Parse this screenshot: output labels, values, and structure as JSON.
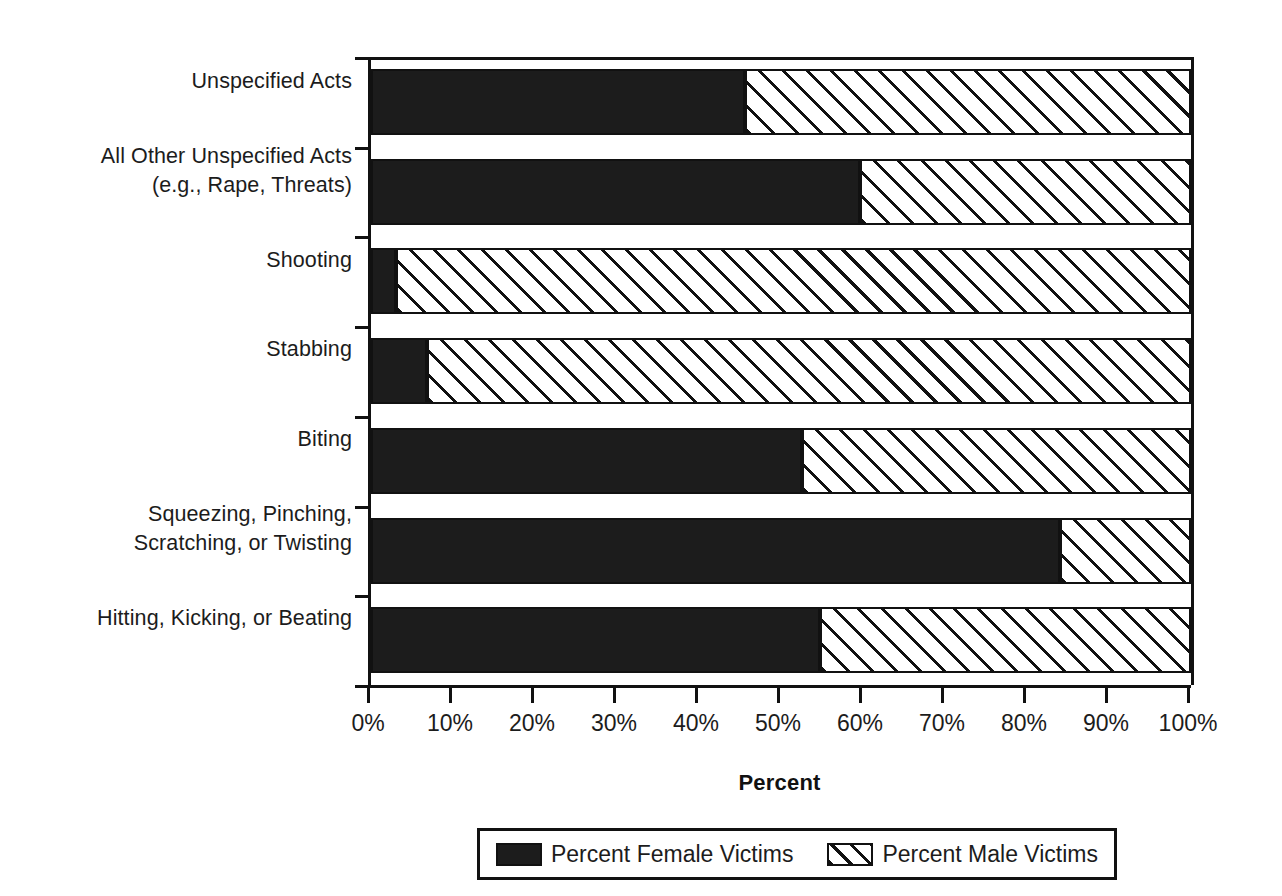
{
  "chart_data": {
    "type": "bar",
    "orientation": "horizontal",
    "stacked": true,
    "normalized": true,
    "title": "",
    "xlabel": "Percent",
    "ylabel": "",
    "xlim": [
      0,
      100
    ],
    "xticks": [
      "0%",
      "10%",
      "20%",
      "30%",
      "40%",
      "50%",
      "60%",
      "70%",
      "80%",
      "90%",
      "100%"
    ],
    "xtick_values": [
      0,
      10,
      20,
      30,
      40,
      50,
      60,
      70,
      80,
      90,
      100
    ],
    "grid": false,
    "legend_position": "bottom",
    "categories": [
      "Unspecified Acts",
      "All Other Unspecified Acts (e.g., Rape, Threats)",
      "Shooting",
      "Stabbing",
      "Biting",
      "Squeezing, Pinching, Scratching, or Twisting",
      "Hitting, Kicking, or Beating"
    ],
    "category_lines": [
      [
        "Unspecified Acts"
      ],
      [
        "All Other Unspecified Acts",
        "(e.g., Rape, Threats)"
      ],
      [
        "Shooting"
      ],
      [
        "Stabbing"
      ],
      [
        "Biting"
      ],
      [
        "Squeezing, Pinching,",
        "Scratching, or Twisting"
      ],
      [
        "Hitting, Kicking, or Beating"
      ]
    ],
    "series": [
      {
        "name": "Percent Female Victims",
        "pattern": "solid-black",
        "color": "#1c1c1c",
        "values": [
          45.6,
          59.6,
          3.0,
          6.8,
          52.6,
          84.0,
          54.8
        ]
      },
      {
        "name": "Percent Male Victims",
        "pattern": "diagonal-hatch",
        "color": "#ffffff",
        "values": [
          54.4,
          40.4,
          97.0,
          93.2,
          47.4,
          16.0,
          45.2
        ]
      }
    ]
  },
  "legend": {
    "items": [
      {
        "label": "Percent Female Victims",
        "swatch": "female-swatch"
      },
      {
        "label": "Percent Male Victims",
        "swatch": "male-swatch"
      }
    ]
  },
  "axis": {
    "x_title": "Percent"
  }
}
